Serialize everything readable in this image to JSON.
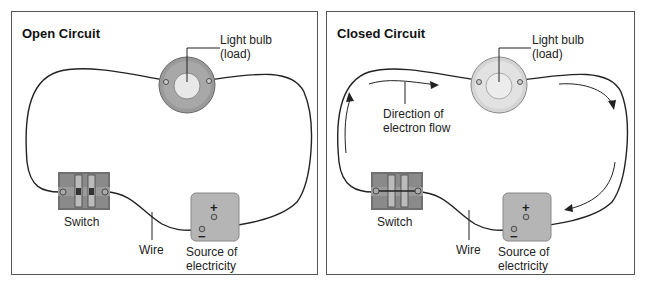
{
  "panels": [
    {
      "title": "Open Circuit",
      "state": "open",
      "labels": {
        "bulb_line1": "Light bulb",
        "bulb_line2": "(load)",
        "switch": "Switch",
        "wire": "Wire",
        "source_line1": "Source of",
        "source_line2": "electricity"
      },
      "battery": {
        "plus": "+",
        "minus": "−"
      }
    },
    {
      "title": "Closed Circuit",
      "state": "closed",
      "labels": {
        "bulb_line1": "Light bulb",
        "bulb_line2": "(load)",
        "flow_line1": "Direction of",
        "flow_line2": "electron flow",
        "switch": "Switch",
        "wire": "Wire",
        "source_line1": "Source of",
        "source_line2": "electricity"
      },
      "battery": {
        "plus": "+",
        "minus": "−"
      }
    }
  ],
  "colors": {
    "border": "#555555",
    "wire": "#222222",
    "bulb_open_ring": "#9a9a9a",
    "bulb_closed_ring": "#d8d8d8",
    "switch_body": "#6e6e6e",
    "battery_body": "#b5b5b5"
  }
}
